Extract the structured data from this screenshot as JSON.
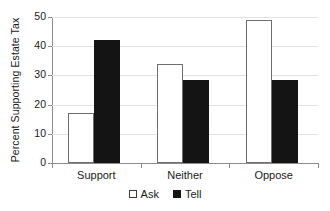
{
  "chart_data": {
    "type": "bar",
    "title": "",
    "subtitle": "",
    "xlabel": "",
    "ylabel": "Percent Supporting Estate Tax",
    "categories": [
      "Support",
      "Neither",
      "Oppose"
    ],
    "series": [
      {
        "name": "Ask",
        "color": "#ffffff",
        "values": [
          17,
          34,
          49
        ]
      },
      {
        "name": "Tell",
        "color": "#141414",
        "values": [
          42,
          28.5,
          28.5
        ]
      }
    ],
    "ylim": [
      0,
      50
    ],
    "ytick_labels": [
      "0",
      "10",
      "20",
      "30",
      "40",
      "50"
    ],
    "ytick_values": [
      0,
      10,
      20,
      30,
      40,
      50
    ],
    "grid": true,
    "grid_axis": "y",
    "legend_position": "bottom"
  },
  "legend": {
    "items": [
      {
        "label": "Ask",
        "swatch": "white-square-swatch"
      },
      {
        "label": "Tell",
        "swatch": "black-square-swatch"
      }
    ]
  },
  "axes": {
    "y_axis_title": "Percent Supporting Estate Tax",
    "y_ticks": [
      "0",
      "10",
      "20",
      "30",
      "40",
      "50"
    ],
    "x_ticks": [
      "Support",
      "Neither",
      "Oppose"
    ]
  }
}
